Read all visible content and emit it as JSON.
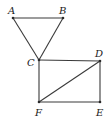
{
  "diagram": {
    "type": "geometry",
    "points": [
      {
        "id": "A",
        "label": "A",
        "x": 13,
        "y": 18,
        "lx": 8,
        "ly": 14
      },
      {
        "id": "B",
        "label": "B",
        "x": 63,
        "y": 18,
        "lx": 59,
        "ly": 14
      },
      {
        "id": "C",
        "label": "C",
        "x": 39,
        "y": 60,
        "lx": 27,
        "ly": 66
      },
      {
        "id": "D",
        "label": "D",
        "x": 100,
        "y": 61,
        "lx": 95,
        "ly": 57
      },
      {
        "id": "E",
        "label": "E",
        "x": 100,
        "y": 102,
        "lx": 96,
        "ly": 116
      },
      {
        "id": "F",
        "label": "F",
        "x": 39,
        "y": 102,
        "lx": 35,
        "ly": 116
      }
    ],
    "segments": [
      [
        "A",
        "B"
      ],
      [
        "A",
        "C"
      ],
      [
        "B",
        "C"
      ],
      [
        "C",
        "D"
      ],
      [
        "D",
        "E"
      ],
      [
        "E",
        "F"
      ],
      [
        "F",
        "C"
      ],
      [
        "F",
        "D"
      ]
    ],
    "colors": {
      "line": "#3a3a3a",
      "text": "#1a1a1a",
      "background": "#ffffff"
    }
  },
  "labels": {
    "A": "A",
    "B": "B",
    "C": "C",
    "D": "D",
    "E": "E",
    "F": "F"
  }
}
